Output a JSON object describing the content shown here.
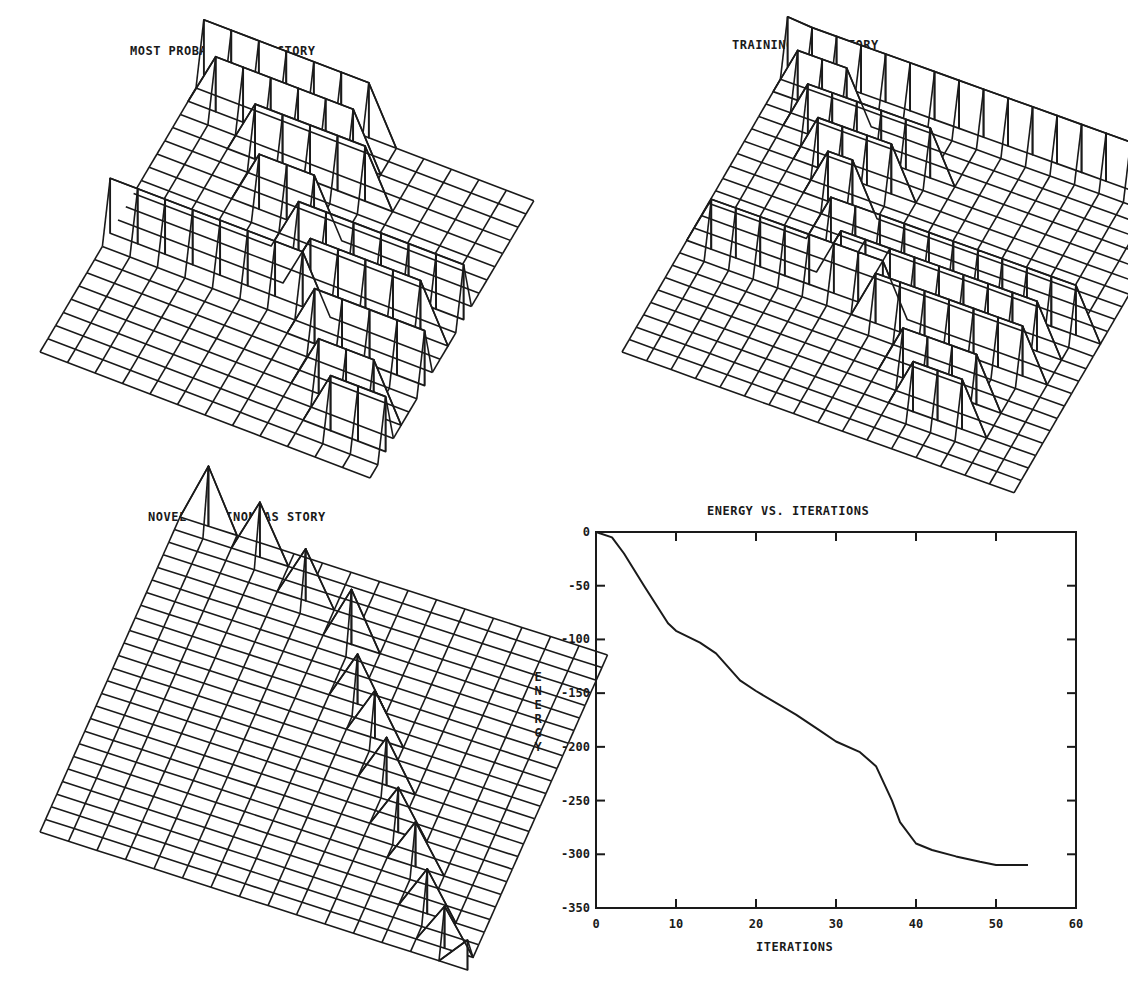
{
  "panels": {
    "most_probable": {
      "title": "MOST PROBABLE TRAJECTORY"
    },
    "training": {
      "title": "TRAINING TRAJECTORY"
    },
    "novel": {
      "title": "NOVEL EPAMINONDAS STORY"
    },
    "energy": {
      "title": "ENERGY VS. ITERATIONS",
      "xlabel": "ITERATIONS",
      "ylabel_letters": [
        "E",
        "N",
        "E",
        "R",
        "G",
        "Y"
      ]
    }
  },
  "chart_data": [
    {
      "type": "surface",
      "title": "MOST PROBABLE TRAJECTORY",
      "description": "3D wireframe mesh with ridges tracing a staircase-like trajectory"
    },
    {
      "type": "surface",
      "title": "TRAINING TRAJECTORY",
      "description": "3D wireframe mesh with ridges tracing the training trajectory"
    },
    {
      "type": "surface",
      "title": "NOVEL EPAMINONDAS STORY",
      "description": "3D wireframe mesh with a diagonal sequence of peaks"
    },
    {
      "type": "line",
      "title": "ENERGY VS. ITERATIONS",
      "xlabel": "ITERATIONS",
      "ylabel": "ENERGY",
      "xlim": [
        0,
        60
      ],
      "ylim": [
        -350,
        0
      ],
      "xticks": [
        0,
        10,
        20,
        30,
        40,
        50,
        60
      ],
      "yticks": [
        0,
        -50,
        -100,
        -150,
        -200,
        -250,
        -300,
        -350
      ],
      "grid": false,
      "series": [
        {
          "name": "Energy",
          "x": [
            0,
            2,
            3.5,
            6,
            9,
            10,
            13,
            15,
            18,
            20,
            25,
            28,
            30,
            33,
            35,
            37,
            38,
            40,
            42,
            45,
            48,
            50,
            54
          ],
          "y": [
            0,
            -5,
            -20,
            -50,
            -85,
            -92,
            -103,
            -113,
            -138,
            -148,
            -170,
            -185,
            -195,
            -205,
            -218,
            -250,
            -270,
            -290,
            -296,
            -302,
            -307,
            -310,
            -310
          ]
        }
      ]
    }
  ]
}
